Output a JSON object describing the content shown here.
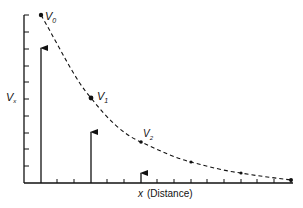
{
  "diagram": {
    "y_axis_label": "V",
    "y_axis_label_sub": "x",
    "x_axis_label_var": "x",
    "x_axis_label_text": "(Distance)",
    "points": [
      {
        "label": "V",
        "sub": "0"
      },
      {
        "label": "V",
        "sub": "1"
      },
      {
        "label": "V",
        "sub": "2"
      }
    ],
    "colors": {
      "ink": "#111111",
      "background": "#ffffff"
    }
  }
}
